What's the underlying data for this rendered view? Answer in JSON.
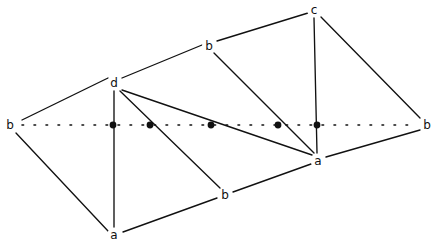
{
  "figure": {
    "name": "labeled-graph-on-dotted-axis",
    "background_color": "#ffffff",
    "stroke_color": "#111111",
    "width": 439,
    "height": 251
  },
  "axis": {
    "name": "horizontal-dotted-line",
    "y": 125,
    "x_start": 22,
    "x_end": 416,
    "style": "dotted",
    "dot_spacing": 12,
    "dot_radius": 1.2
  },
  "nodes": [
    {
      "id": "n1",
      "label": "b",
      "x": 10,
      "y": 125,
      "marker": false,
      "on_axis": true
    },
    {
      "id": "n2",
      "label": "d",
      "x": 114,
      "y": 83,
      "marker": false,
      "on_axis": false
    },
    {
      "id": "n3",
      "label": "b",
      "x": 209,
      "y": 46,
      "marker": false,
      "on_axis": false
    },
    {
      "id": "n4",
      "label": "c",
      "x": 314,
      "y": 10,
      "marker": false,
      "on_axis": false
    },
    {
      "id": "n5",
      "label": "b",
      "x": 427,
      "y": 125,
      "marker": false,
      "on_axis": true
    },
    {
      "id": "n6",
      "label": "a",
      "x": 318,
      "y": 161,
      "marker": false,
      "on_axis": false
    },
    {
      "id": "n7",
      "label": "b",
      "x": 225,
      "y": 195,
      "marker": false,
      "on_axis": false
    },
    {
      "id": "n8",
      "label": "a",
      "x": 114,
      "y": 235,
      "marker": false,
      "on_axis": false
    }
  ],
  "axis_markers": [
    {
      "id": "m1",
      "x": 113,
      "y": 125,
      "radius": 3.4
    },
    {
      "id": "m2",
      "x": 150,
      "y": 125,
      "radius": 3.4
    },
    {
      "id": "m3",
      "x": 211,
      "y": 125,
      "radius": 3.4
    },
    {
      "id": "m4",
      "x": 278,
      "y": 125,
      "radius": 3.4
    },
    {
      "id": "m5",
      "x": 317,
      "y": 125,
      "radius": 3.4
    }
  ],
  "edges": [
    {
      "id": "e1",
      "from": "b-left",
      "to": "d",
      "x1": 22,
      "y1": 120,
      "x2": 108,
      "y2": 78
    },
    {
      "id": "e2",
      "from": "d",
      "to": "b-top",
      "x1": 122,
      "y1": 78,
      "x2": 202,
      "y2": 45
    },
    {
      "id": "e3",
      "from": "b-top",
      "to": "c",
      "x1": 217,
      "y1": 41,
      "x2": 308,
      "y2": 13
    },
    {
      "id": "e4",
      "from": "c",
      "to": "a-right",
      "x1": 314,
      "y1": 18,
      "x2": 317,
      "y2": 153
    },
    {
      "id": "e5",
      "from": "c",
      "to": "b-right",
      "x1": 321,
      "y1": 17,
      "x2": 420,
      "y2": 118
    },
    {
      "id": "e6",
      "from": "b-top",
      "to": "a-right",
      "x1": 214,
      "y1": 53,
      "x2": 314,
      "y2": 153
    },
    {
      "id": "e7",
      "from": "d",
      "to": "a-right",
      "x1": 122,
      "y1": 90,
      "x2": 312,
      "y2": 155
    },
    {
      "id": "e8",
      "from": "d",
      "to": "b-bottom",
      "x1": 120,
      "y1": 91,
      "x2": 220,
      "y2": 188
    },
    {
      "id": "e9",
      "from": "d",
      "to": "a-bottom",
      "x1": 114,
      "y1": 91,
      "x2": 114,
      "y2": 227
    },
    {
      "id": "e10",
      "from": "b-left",
      "to": "a-bottom",
      "x1": 16,
      "y1": 133,
      "x2": 108,
      "y2": 231
    },
    {
      "id": "e11",
      "from": "a-bottom",
      "to": "b-bottom",
      "x1": 123,
      "y1": 232,
      "x2": 217,
      "y2": 198
    },
    {
      "id": "e12",
      "from": "b-bottom",
      "to": "a-right",
      "x1": 233,
      "y1": 192,
      "x2": 311,
      "y2": 164
    },
    {
      "id": "e13",
      "from": "a-right",
      "to": "b-right",
      "x1": 326,
      "y1": 157,
      "x2": 420,
      "y2": 130
    }
  ]
}
